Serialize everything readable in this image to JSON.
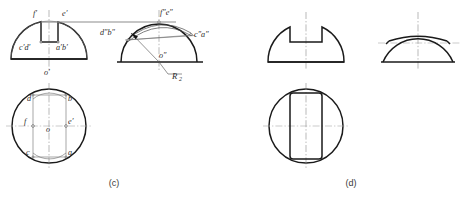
{
  "figure": {
    "captions": [
      {
        "id": "caption-c",
        "text": "(c)",
        "x": 114,
        "y": 186
      },
      {
        "id": "caption-d",
        "text": "(d)",
        "x": 351,
        "y": 186
      }
    ]
  },
  "panel_c": {
    "name": "panel-c",
    "front_view": {
      "name": "front-view-c",
      "labels": [
        {
          "id": "f-prime",
          "text": "f′",
          "x": 33,
          "y": 16
        },
        {
          "id": "e-prime",
          "text": "e′",
          "x": 64,
          "y": 16
        },
        {
          "id": "c-prime-d-prime",
          "text": "c′d′",
          "x": 23,
          "y": 47
        },
        {
          "id": "a-prime-b-prime",
          "text": "a′b′",
          "x": 60,
          "y": 47
        },
        {
          "id": "o-prime",
          "text": "o′",
          "x": 46,
          "y": 73
        }
      ]
    },
    "side_view": {
      "name": "side-view-c",
      "labels": [
        {
          "id": "f-dblprime-e-dblprime",
          "text": "f″e″",
          "x": 163,
          "y": 15
        },
        {
          "id": "d-dblprime-b-dblprime",
          "text": "d″b″",
          "x": 104,
          "y": 33
        },
        {
          "id": "c-dblprime-a-dblprime",
          "text": "c″a″",
          "x": 196,
          "y": 36
        },
        {
          "id": "o-dblprime",
          "text": "o″",
          "x": 162,
          "y": 57
        }
      ],
      "radius_note": {
        "id": "radius-label",
        "text": "R",
        "subscript": "2",
        "x": 172,
        "y": 76
      }
    },
    "top_view": {
      "name": "top-view-c",
      "labels": [
        {
          "id": "d",
          "text": "d",
          "x": 29,
          "y": 99
        },
        {
          "id": "b",
          "text": "b",
          "x": 66,
          "y": 99
        },
        {
          "id": "f",
          "text": "f",
          "x": 26,
          "y": 121
        },
        {
          "id": "e",
          "text": "e′",
          "x": 66,
          "y": 121
        },
        {
          "id": "o",
          "text": "o",
          "x": 49,
          "y": 134
        },
        {
          "id": "c",
          "text": "c",
          "x": 28,
          "y": 152
        },
        {
          "id": "a",
          "text": "a",
          "x": 66,
          "y": 152
        }
      ]
    }
  },
  "panel_d": {
    "name": "panel-d",
    "views": [
      {
        "id": "front-view-d",
        "label": ""
      },
      {
        "id": "side-view-d",
        "label": ""
      },
      {
        "id": "top-view-d",
        "label": ""
      }
    ]
  },
  "colors": {
    "outline": "#1a1a1a",
    "thin": "#6d6d6d",
    "centerline": "#8a8a8a",
    "projection": "#8f8f8f",
    "background": "#ffffff",
    "text": "#2b2b2b"
  }
}
